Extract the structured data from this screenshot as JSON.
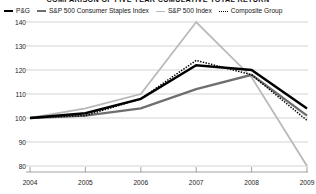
{
  "chart_data": {
    "type": "line",
    "title": "COMPARISON OF FIVE YEAR CUMULATIVE TOTAL RETURN",
    "xlabel": "",
    "ylabel": "",
    "categories": [
      "2004",
      "2005",
      "2006",
      "2007",
      "2008",
      "2009"
    ],
    "x": [
      2004,
      2005,
      2006,
      2007,
      2008,
      2009
    ],
    "ylim": [
      80,
      140
    ],
    "yticks": [
      80,
      90,
      100,
      110,
      120,
      130,
      140
    ],
    "ytick_labels": [
      "80",
      "90",
      "100",
      "110",
      "120",
      "130",
      "140"
    ],
    "grid": true,
    "legend_position": "top",
    "series": [
      {
        "name": "P&G",
        "color": "#000000",
        "style": "solid",
        "width": 2.4,
        "values": [
          100,
          102,
          108,
          122,
          120,
          104
        ]
      },
      {
        "name": "S&P 500 Consumer Staples Index",
        "color": "#6e6e6e",
        "style": "solid",
        "width": 2.4,
        "values": [
          100,
          101,
          104,
          112,
          118,
          101
        ]
      },
      {
        "name": "S&P 500 Index",
        "color": "#b9b9b9",
        "style": "solid",
        "width": 1.8,
        "values": [
          100,
          104,
          110,
          140,
          117,
          80
        ]
      },
      {
        "name": "Composite Group",
        "color": "#000000",
        "style": "dotted",
        "width": 1.5,
        "values": [
          100,
          101,
          108,
          124,
          118,
          99
        ]
      }
    ]
  },
  "legend": {
    "items": [
      {
        "label": "P&G",
        "swatch": "pg-line-swatch"
      },
      {
        "label": "S&P 500 Consumer Staples Index",
        "swatch": "staples-line-swatch"
      },
      {
        "label": "S&P 500 Index",
        "swatch": "sp500-line-swatch"
      },
      {
        "label": "Composite Group",
        "swatch": "composite-line-swatch"
      }
    ]
  },
  "axes": {
    "y_labels": [
      "140",
      "130",
      "120",
      "110",
      "100",
      "90",
      "80"
    ],
    "x_labels": [
      "2004",
      "2005",
      "2006",
      "2007",
      "2008",
      "2009"
    ]
  },
  "colors": {
    "pg": "#000000",
    "consumer_staples": "#6e6e6e",
    "sp500": "#b9b9b9",
    "composite": "#000000",
    "grid": "#c8c8c8",
    "axis": "#8c8c8c",
    "background": "#ffffff"
  }
}
